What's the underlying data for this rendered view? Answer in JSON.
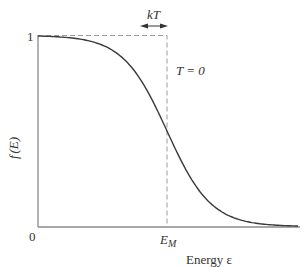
{
  "chart_data": {
    "type": "line",
    "title": "",
    "xlabel": "Energy ε",
    "ylabel": "f (E)",
    "x_tick_labels": [
      "0",
      "E_M"
    ],
    "y_tick_labels": [
      "1"
    ],
    "annotations": [
      "kT",
      "T = 0"
    ],
    "series": [
      {
        "name": "f(E) at T > 0 (Fermi–Dirac)",
        "style": "solid",
        "description": "smooth step from 1 to 0 centred at E_M, width ~kT",
        "x": [
          0,
          0.2,
          0.4,
          0.6,
          0.8,
          1.0,
          1.2,
          1.4,
          1.6,
          1.8,
          2.0
        ],
        "y": [
          1.0,
          0.99,
          0.97,
          0.9,
          0.73,
          0.5,
          0.27,
          0.1,
          0.03,
          0.01,
          0.0
        ]
      },
      {
        "name": "f(E) at T = 0",
        "style": "dashed",
        "description": "step function: 1 for E < E_M, 0 for E > E_M",
        "x": [
          0,
          1.0,
          1.0
        ],
        "y": [
          1,
          1,
          0
        ]
      }
    ],
    "ylim": [
      0,
      1
    ],
    "grid": false,
    "legend": "none"
  },
  "labels": {
    "y_one": "1",
    "origin": "0",
    "ylabel_f": "f",
    "ylabel_E": "(E)",
    "em_E": "E",
    "em_sub": "M",
    "xlabel": "Energy  ε",
    "kt": "kT",
    "t0": "T = 0"
  },
  "colors": {
    "axis": "#808080",
    "curve": "#3a3a3a",
    "dashed": "#9a9a9a",
    "text": "#333333"
  }
}
